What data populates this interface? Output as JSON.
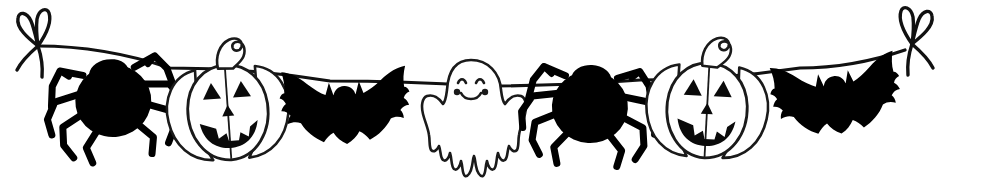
{
  "illustration": {
    "title": "Halloween Garland Bunting",
    "subject": "halloween-garland",
    "style": "black-and-white-clipart",
    "background_color": "#ffffff",
    "ink_color": "#111111",
    "fill_color": "#000000",
    "outline_color": "#1a1a1a",
    "width": 999,
    "height": 191
  },
  "string": {
    "name": "hanging-string",
    "description": "Thin black string sagging across the image from upper-left to upper-right",
    "stroke_color": "#111111",
    "stroke_width": 3.2,
    "points": [
      {
        "x": 38,
        "y": 46
      },
      {
        "x": 170,
        "y": 68
      },
      {
        "x": 330,
        "y": 81
      },
      {
        "x": 480,
        "y": 86
      },
      {
        "x": 640,
        "y": 80
      },
      {
        "x": 800,
        "y": 68
      },
      {
        "x": 905,
        "y": 50
      }
    ]
  },
  "bows": [
    {
      "name": "bow-left",
      "label": "Left tie bow",
      "x": 38,
      "y": 46,
      "flip": false
    },
    {
      "name": "bow-right",
      "label": "Right tie bow",
      "x": 912,
      "y": 44,
      "flip": true
    }
  ],
  "figures": [
    {
      "index": 1,
      "type": "spider",
      "name": "spider-left",
      "label": "Spider",
      "center_x": 113,
      "center_y": 99,
      "body_rx": 38,
      "body_ry": 35,
      "rotation": -9,
      "fill": "#000000",
      "legs": 8
    },
    {
      "index": 2,
      "type": "pumpkin",
      "name": "pumpkin-left",
      "label": "Jack-o'-lantern",
      "center_x": 228,
      "center_y": 112,
      "radius_x": 52,
      "radius_y": 50,
      "rotation": -4,
      "fill": "#ffffff",
      "face": "triangular eyes, triangular nose, toothy grin",
      "stem": "curved leaning stem"
    },
    {
      "index": 3,
      "type": "bat",
      "name": "bat-left",
      "label": "Bat",
      "center_x": 345,
      "center_y": 104,
      "wingspan": 130,
      "rotation": -3,
      "fill": "#000000"
    },
    {
      "index": 4,
      "type": "ghost",
      "name": "ghost-center",
      "label": "Ghost",
      "center_x": 471,
      "center_y": 112,
      "width": 92,
      "height": 105,
      "rotation": 0,
      "fill": "#ffffff",
      "face": "two arched eyes, two cheek dots, smiling mouth"
    },
    {
      "index": 5,
      "type": "spider",
      "name": "spider-right",
      "label": "Spider",
      "center_x": 590,
      "center_y": 105,
      "body_rx": 40,
      "body_ry": 36,
      "rotation": 3,
      "fill": "#000000",
      "legs": 8
    },
    {
      "index": 6,
      "type": "pumpkin",
      "name": "pumpkin-right",
      "label": "Jack-o'-lantern",
      "center_x": 707,
      "center_y": 110,
      "radius_x": 54,
      "radius_y": 51,
      "rotation": 3,
      "fill": "#ffffff",
      "face": "triangular eyes, triangular nose, toothy grin",
      "stem": "curved leaning stem"
    },
    {
      "index": 7,
      "type": "bat",
      "name": "bat-right",
      "label": "Bat",
      "center_x": 836,
      "center_y": 94,
      "wingspan": 132,
      "rotation": -8,
      "fill": "#000000"
    }
  ],
  "counts": {
    "spiders": 2,
    "pumpkins": 2,
    "bats": 2,
    "ghosts": 1,
    "bows": 2,
    "total_figures": 7
  }
}
